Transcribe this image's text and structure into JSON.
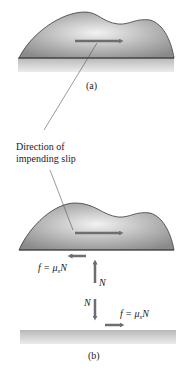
{
  "figure": {
    "panel_a": {
      "label": "(a)",
      "callout": {
        "line1": "Direction of",
        "line2": "impending slip"
      }
    },
    "panel_b": {
      "label": "(b)",
      "force_upper": {
        "friction_prefix": "f = μ",
        "friction_sub": "s",
        "friction_suffix": "N",
        "normal": "N"
      },
      "force_lower": {
        "friction_prefix": "f = μ",
        "friction_sub": "s",
        "friction_suffix": "N",
        "normal": "N"
      }
    },
    "colors": {
      "arrow": "#6e6e72",
      "body_fill_light": "#e8e8e8",
      "body_fill_dark": "#8a8a8a",
      "outline": "#3a3a3a",
      "ground": "#c8c8c8"
    }
  }
}
